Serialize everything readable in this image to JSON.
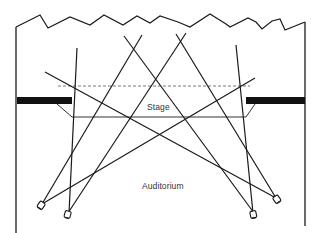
{
  "diagram": {
    "type": "stage lighting plan",
    "labels": {
      "stage": "Stage",
      "auditorium": "Auditorium"
    },
    "colors": {
      "ink": "#1a1a1a",
      "background": "#ffffff"
    },
    "elements": {
      "spotlights": [
        "left-front-1",
        "left-front-2",
        "right-front-1",
        "right-front-2"
      ],
      "proscenium_bars": [
        "left",
        "right"
      ],
      "dashed_line": "upstage border",
      "stage_edge": "apron edge"
    }
  }
}
